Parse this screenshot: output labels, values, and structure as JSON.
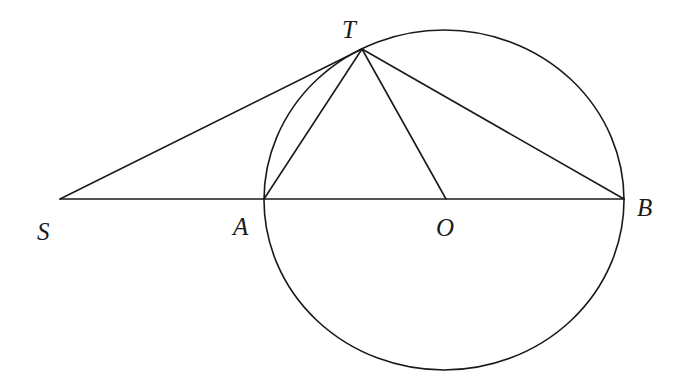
{
  "diagram": {
    "type": "geometry",
    "points": {
      "S": {
        "label": "S",
        "x": 60,
        "y": 199
      },
      "A": {
        "label": "A",
        "x": 264,
        "y": 199
      },
      "O": {
        "label": "O",
        "x": 446,
        "y": 199
      },
      "B": {
        "label": "B",
        "x": 624,
        "y": 199
      },
      "T": {
        "label": "T",
        "x": 362,
        "y": 49
      }
    },
    "circle": {
      "center": "O",
      "cx": 444,
      "cy": 200,
      "rx": 180,
      "ry": 170
    },
    "segments": [
      [
        "S",
        "B"
      ],
      [
        "S",
        "T"
      ],
      [
        "T",
        "A"
      ],
      [
        "T",
        "O"
      ],
      [
        "T",
        "B"
      ]
    ],
    "colors": {
      "stroke": "#1a1a1a",
      "background": "#ffffff"
    }
  }
}
